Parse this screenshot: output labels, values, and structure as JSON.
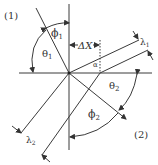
{
  "diagram": {
    "type": "refraction-geometry",
    "labels": {
      "medium1": "(1)",
      "medium2": "(2)",
      "phi1": "ϕ",
      "phi1_sub": "1",
      "theta1": "θ",
      "theta1_sub": "1",
      "theta2": "θ",
      "theta2_sub": "2",
      "phi2": "ϕ",
      "phi2_sub": "2",
      "delta_x": "ΔX",
      "lambda1": "λ",
      "lambda1_sub": "1",
      "lambda2": "λ",
      "lambda2_sub": "2",
      "alpha": "α"
    },
    "colors": {
      "line": "#3a3a3a",
      "text": "#333333",
      "background": "#ffffff"
    }
  }
}
